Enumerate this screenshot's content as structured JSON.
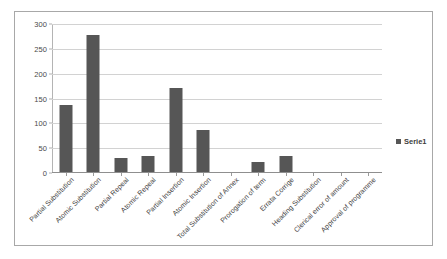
{
  "chart_data": {
    "type": "bar",
    "title": "",
    "subtitle": "",
    "xlabel": "",
    "ylabel": "",
    "ylim": [
      0,
      300
    ],
    "ytick_step": 50,
    "yticks": [
      "300",
      "250",
      "200",
      "150",
      "100",
      "50",
      "0"
    ],
    "grid": true,
    "legend_position": "right",
    "bar_color": "#565656",
    "gridline_color": "#d2d2d2",
    "axis_color": "#8f8f8f",
    "categories": [
      "Partial Substitution",
      "Atomic Substitution",
      "Partial Repeal",
      "Atomic Repeal",
      "Partial Insertion",
      "Atomic Insertion",
      "Total Substitution of Annex",
      "Prorogation of term",
      "Errata Corrige",
      "Heading Substitution",
      "Clerical error of amount",
      "Approval of programme"
    ],
    "series": [
      {
        "name": "Serie1",
        "values": [
          137,
          278,
          31,
          34,
          172,
          87,
          1,
          23,
          34,
          0,
          0,
          2
        ]
      }
    ]
  },
  "legend": {
    "entries": [
      {
        "label": "Serie1",
        "color": "#565656",
        "marker": "legend-square-marker"
      }
    ]
  }
}
